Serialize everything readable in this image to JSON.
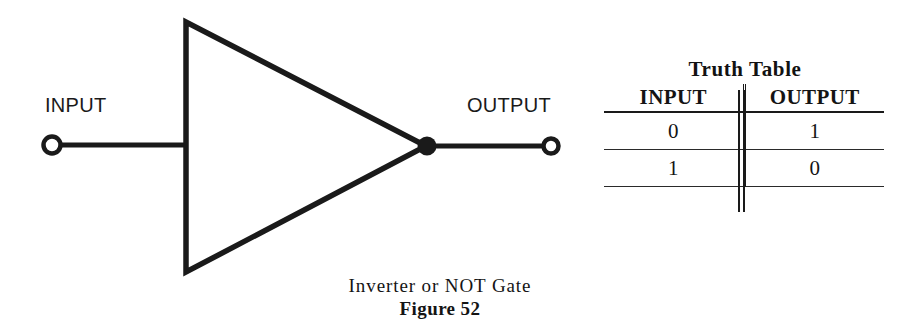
{
  "figure": {
    "background_color": "#ffffff",
    "ink_color": "#1a1a1a",
    "caption_line_1": "Inverter or NOT Gate",
    "caption_line_2": "Figure 52"
  },
  "schematic": {
    "title": "Inverter / NOT gate logic symbol",
    "input_label": "INPUT",
    "output_label": "OUTPUT",
    "input_terminal_icon": "open-circle-terminal-icon",
    "output_terminal_icon": "open-circle-terminal-icon",
    "junction_icon": "filled-dot-icon",
    "gate_shape": "triangle"
  },
  "truth_table": {
    "title": "Truth Table",
    "columns": [
      "INPUT",
      "OUTPUT"
    ],
    "rows": [
      {
        "input": "0",
        "output": "1"
      },
      {
        "input": "1",
        "output": "0"
      }
    ]
  }
}
